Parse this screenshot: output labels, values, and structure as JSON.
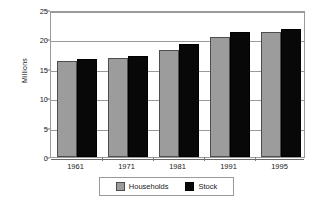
{
  "chart_data": {
    "type": "bar",
    "title": "",
    "xlabel": "",
    "ylabel": "Millions",
    "categories": [
      "1961",
      "1971",
      "1981",
      "1991",
      "1995"
    ],
    "series": [
      {
        "name": "Households",
        "color": "#9c9c9c",
        "values": [
          16.3,
          16.8,
          18.2,
          20.4,
          21.3
        ]
      },
      {
        "name": "Stock",
        "color": "#080808",
        "values": [
          16.7,
          17.2,
          19.2,
          21.2,
          21.7
        ]
      }
    ],
    "ylim": [
      0,
      25
    ],
    "yticks": [
      0,
      5,
      10,
      15,
      20,
      25
    ],
    "ytick_labels": [
      "0",
      "5",
      "10",
      "15",
      "20",
      "25"
    ],
    "grid": true,
    "legend_position": "bottom"
  },
  "axis": {
    "y_title": "Millions",
    "y_labels": [
      "25",
      "20",
      "15",
      "10",
      "5",
      "0"
    ],
    "x_labels": [
      "1961",
      "1971",
      "1981",
      "1991",
      "1995"
    ]
  },
  "legend": {
    "entries": [
      {
        "label": "Households"
      },
      {
        "label": "Stock"
      }
    ]
  }
}
